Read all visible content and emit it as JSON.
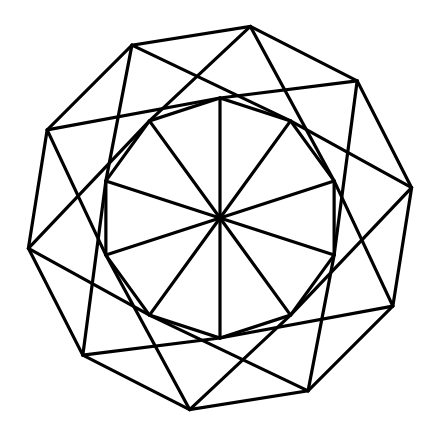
{
  "figure": {
    "type": "geometric-line-diagram",
    "background_color": "#ffffff",
    "stroke_color": "#000000",
    "stroke_width": 3.2,
    "canvas": {
      "width": 439,
      "height": 437
    },
    "center": {
      "x": 220,
      "y": 218
    },
    "symmetry_order": 10,
    "outer_polygon": {
      "name": "outer-decagon",
      "sides": 10,
      "circumradius": 194,
      "rotation_degrees": 9,
      "vertex_count": 10
    },
    "inner_polygon": {
      "name": "inner-decagon",
      "sides": 10,
      "circumradius": 120,
      "rotation_degrees": 0,
      "vertex_count": 10
    },
    "spokes": {
      "name": "center-spokes",
      "count": 10,
      "from": "center",
      "to": "inner-decagon-vertices"
    },
    "cross_chords": {
      "name": "outer-to-inner-chords",
      "count": 20,
      "description": "each outer vertex joins the two inner vertices offset by two steps, forming crossings"
    }
  }
}
